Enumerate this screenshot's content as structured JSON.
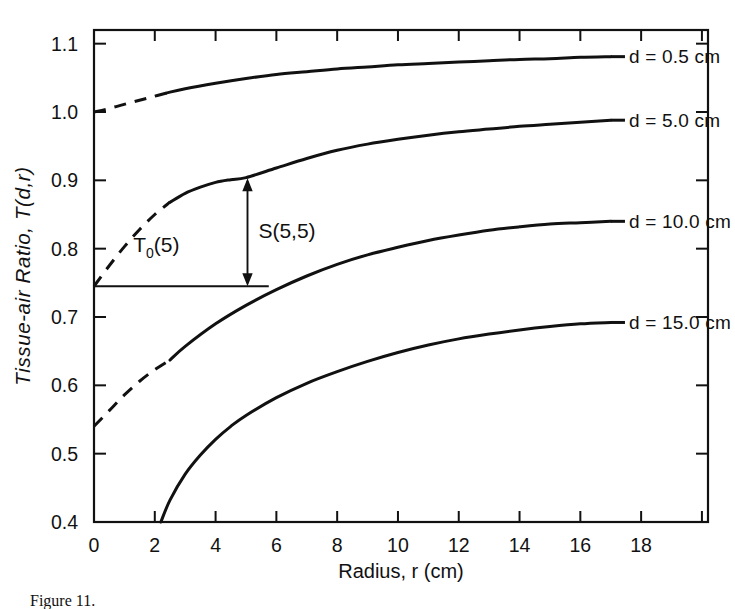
{
  "figure": {
    "kind": "line-chart",
    "background": "#ffffff",
    "ink_color": "#111111"
  },
  "chart_data": {
    "type": "line",
    "title": "",
    "xlabel": "Radius, r (cm)",
    "ylabel": "Tissue-air Ratio, T(d,r)",
    "xlim": [
      0,
      20.2
    ],
    "ylim": [
      0.4,
      1.12
    ],
    "grid": false,
    "legend_position": "right-of-curve-ends",
    "xticks": [
      0,
      2,
      4,
      6,
      8,
      10,
      12,
      14,
      16,
      18
    ],
    "xticklabels": [
      "0",
      "2",
      "4",
      "6",
      "8",
      "10",
      "12",
      "14",
      "16",
      "18"
    ],
    "yticks": [
      0.4,
      0.5,
      0.6,
      0.7,
      0.8,
      0.9,
      1.0,
      1.1
    ],
    "yticklabels": [
      "0.4",
      "0.5",
      "0.6",
      "0.7",
      "0.8",
      "0.9",
      "1.0",
      "1.1"
    ],
    "series": [
      {
        "name": "d = 0.5 cm",
        "label": "d = 0.5 cm",
        "label_x": 17.6,
        "label_y": 1.081,
        "dashed_x": [
          0,
          0.4,
          0.9,
          1.4,
          1.9,
          2.4
        ],
        "dashed_y": [
          1.0,
          1.004,
          1.01,
          1.016,
          1.022,
          1.028
        ],
        "solid_x": [
          2.4,
          3,
          4,
          5,
          6,
          7,
          8,
          9,
          10,
          11,
          12,
          13,
          14,
          15,
          16,
          17
        ],
        "solid_y": [
          1.028,
          1.034,
          1.042,
          1.049,
          1.055,
          1.059,
          1.063,
          1.066,
          1.069,
          1.071,
          1.073,
          1.075,
          1.077,
          1.078,
          1.08,
          1.081
        ]
      },
      {
        "name": "d = 5.0 cm",
        "label": "d = 5.0 cm",
        "label_x": 17.6,
        "label_y": 0.988,
        "dashed_x": [
          0,
          0.5,
          1.0,
          1.5,
          2.0,
          2.5
        ],
        "dashed_y": [
          0.745,
          0.775,
          0.803,
          0.828,
          0.85,
          0.868
        ],
        "solid_x": [
          2.5,
          3,
          3.5,
          4,
          4.5,
          5,
          6,
          7,
          8,
          9,
          10,
          11,
          12,
          13,
          14,
          15,
          16,
          17
        ],
        "solid_y": [
          0.868,
          0.881,
          0.89,
          0.897,
          0.901,
          0.904,
          0.918,
          0.932,
          0.944,
          0.953,
          0.96,
          0.966,
          0.971,
          0.975,
          0.979,
          0.982,
          0.985,
          0.988
        ]
      },
      {
        "name": "d = 10.0 cm",
        "label": "d = 10.0 cm",
        "label_x": 17.6,
        "label_y": 0.84,
        "dashed_x": [
          0,
          0.5,
          1.0,
          1.5,
          2.0,
          2.5
        ],
        "dashed_y": [
          0.54,
          0.563,
          0.586,
          0.606,
          0.623,
          0.637
        ],
        "solid_x": [
          2.5,
          3,
          4,
          5,
          6,
          7,
          8,
          9,
          10,
          11,
          12,
          13,
          14,
          15,
          16,
          17
        ],
        "solid_y": [
          0.637,
          0.657,
          0.69,
          0.717,
          0.74,
          0.76,
          0.777,
          0.791,
          0.802,
          0.812,
          0.82,
          0.827,
          0.832,
          0.836,
          0.838,
          0.84
        ]
      },
      {
        "name": "d = 15.0 cm",
        "label": "d = 15.0 cm",
        "label_x": 17.6,
        "label_y": 0.692,
        "dashed_x": [],
        "dashed_y": [],
        "solid_x": [
          2.2,
          2.5,
          3,
          3.5,
          4,
          4.5,
          5,
          6,
          7,
          8,
          9,
          10,
          11,
          12,
          13,
          14,
          15,
          16,
          17
        ],
        "solid_y": [
          0.4,
          0.432,
          0.47,
          0.498,
          0.521,
          0.54,
          0.556,
          0.582,
          0.603,
          0.62,
          0.635,
          0.648,
          0.659,
          0.668,
          0.675,
          0.681,
          0.686,
          0.69,
          0.692
        ]
      }
    ],
    "annotations": [
      {
        "id": "t0-baseline",
        "kind": "horizontal-line",
        "label": "T₀(5)",
        "label_main": "T",
        "label_sub": "0",
        "label_tail": "(5)",
        "y_value": 0.745,
        "x_start": 0,
        "x_end": 5.75,
        "label_x": 2.05,
        "label_y": 0.795
      },
      {
        "id": "scatter-arrow",
        "kind": "double-arrow-vertical",
        "label": "S(5,5)",
        "x_value": 5.05,
        "y_bottom": 0.745,
        "y_top": 0.903,
        "label_x": 6.35,
        "label_y": 0.815
      }
    ]
  },
  "caption": {
    "text": "Figure 11."
  }
}
